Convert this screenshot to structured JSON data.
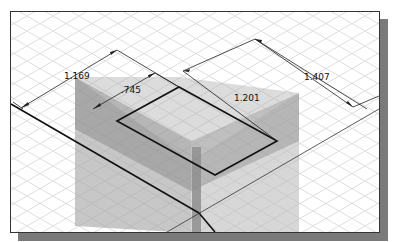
{
  "drawing": {
    "view": "isometric",
    "grid": {
      "visible": true,
      "color": "#c9c9c9"
    },
    "frame": {
      "border_color": "#333333",
      "shadow_color": "#7a7a7a"
    },
    "colors": {
      "top_face": "#b4b4b4",
      "left_face": "#8e8e8e",
      "right_face": "#9c9c9c",
      "lower_left": "#a8a8a8",
      "lower_right": "#bdbdbd",
      "edge": "#111111",
      "dim_line": "#222222"
    },
    "dimensions": [
      {
        "id": "dim-1169",
        "label": "1.169"
      },
      {
        "id": "dim-745",
        "label": ".745"
      },
      {
        "id": "dim-1201",
        "label": "1.201"
      },
      {
        "id": "dim-1407",
        "label": "1.407"
      }
    ]
  }
}
